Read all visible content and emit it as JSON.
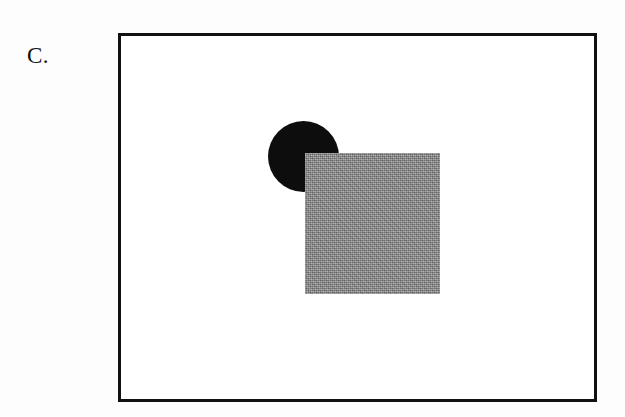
{
  "figure": {
    "panel_label": "C.",
    "background_color": "#fdfdfd",
    "width": 625,
    "height": 417
  },
  "frame": {
    "name": "stimulus-frame",
    "border_color": "#111111",
    "border_width": 3,
    "fill_color": "#ffffff",
    "x": 118,
    "y": 33,
    "width": 479,
    "height": 369
  },
  "shapes": [
    {
      "name": "occluded-circle",
      "type": "circle",
      "fill": "solid-black",
      "color": "#0d0d0d",
      "center_x": 303,
      "center_y": 156,
      "diameter": 71,
      "depth_order": "behind"
    },
    {
      "name": "occluding-square",
      "type": "square",
      "fill": "halftone-gray",
      "color": "#8c8c8c",
      "x": 305,
      "y": 153,
      "width": 135,
      "height": 141,
      "depth_order": "front"
    }
  ]
}
